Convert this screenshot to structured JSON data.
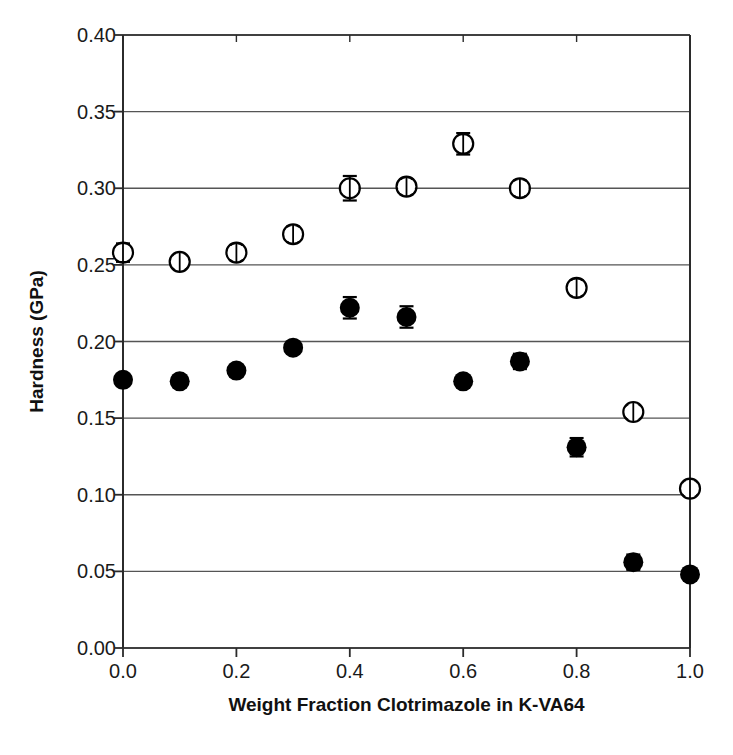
{
  "chart_data": {
    "type": "scatter",
    "title": "",
    "xlabel": "Weight Fraction Clotrimazole in K-VA64",
    "ylabel": "Hardness (GPa)",
    "xlim": [
      0.0,
      1.0
    ],
    "ylim": [
      0.0,
      0.4
    ],
    "xticks": [
      "0.0",
      "0.2",
      "0.4",
      "0.6",
      "0.8",
      "1.0"
    ],
    "xtick_values": [
      0.0,
      0.2,
      0.4,
      0.6,
      0.8,
      1.0
    ],
    "yticks": [
      "0.00",
      "0.05",
      "0.10",
      "0.15",
      "0.20",
      "0.25",
      "0.30",
      "0.35",
      "0.40"
    ],
    "ytick_values": [
      0.0,
      0.05,
      0.1,
      0.15,
      0.2,
      0.25,
      0.3,
      0.35,
      0.4
    ],
    "grid": "horizontal",
    "legend": "none",
    "x": [
      0.0,
      0.1,
      0.2,
      0.3,
      0.4,
      0.5,
      0.6,
      0.7,
      0.8,
      0.9,
      1.0
    ],
    "series": [
      {
        "name": "open-circle-series",
        "marker": "open-circle",
        "color": "#000000",
        "fill": "#ffffff",
        "values": [
          0.258,
          0.252,
          0.258,
          0.27,
          0.3,
          0.301,
          0.329,
          0.3,
          0.235,
          0.154,
          0.104
        ],
        "errors": [
          0.006,
          0.004,
          0.005,
          0.005,
          0.008,
          0.005,
          0.007,
          0.005,
          0.005,
          0.004,
          0.004
        ]
      },
      {
        "name": "filled-circle-series",
        "marker": "filled-circle",
        "color": "#000000",
        "fill": "#000000",
        "values": [
          0.175,
          0.174,
          0.181,
          0.196,
          0.222,
          0.216,
          0.174,
          0.187,
          0.131,
          0.056,
          0.048
        ],
        "errors": [
          0.0,
          0.0,
          0.0,
          0.0,
          0.007,
          0.007,
          0.0,
          0.005,
          0.006,
          0.005,
          0.0
        ]
      }
    ]
  },
  "axes": {
    "frame_color": "#2b2b2b",
    "grid_color": "#555555"
  },
  "caption": {
    "text": ""
  }
}
